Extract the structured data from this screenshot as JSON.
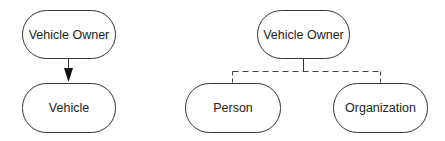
{
  "diagram": {
    "left": {
      "nodes": [
        {
          "id": "vehicle-owner-1",
          "label": "Vehicle Owner",
          "x": 22,
          "y": 10,
          "w": 93,
          "h": 48
        },
        {
          "id": "vehicle",
          "label": "Vehicle",
          "x": 22,
          "y": 83,
          "w": 93,
          "h": 49
        }
      ],
      "edges": [
        {
          "from": "vehicle-owner-1",
          "to": "vehicle",
          "style": "solid",
          "arrow": "filled-head"
        }
      ]
    },
    "right": {
      "nodes": [
        {
          "id": "vehicle-owner-2",
          "label": "Vehicle Owner",
          "x": 257,
          "y": 10,
          "w": 92,
          "h": 48
        },
        {
          "id": "person",
          "label": "Person",
          "x": 185,
          "y": 83,
          "w": 95,
          "h": 49
        },
        {
          "id": "organization",
          "label": "Organization",
          "x": 333,
          "y": 83,
          "w": 94,
          "h": 49
        }
      ],
      "edges": [
        {
          "from": "vehicle-owner-2",
          "to": "person",
          "style": "dashed"
        },
        {
          "from": "vehicle-owner-2",
          "to": "organization",
          "style": "dashed"
        }
      ]
    },
    "colors": {
      "stroke": "#333333",
      "text": "#222222",
      "background": "#ffffff"
    }
  }
}
